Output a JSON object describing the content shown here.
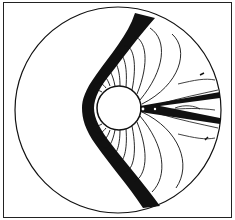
{
  "figure": {
    "type": "flow-contour-plot",
    "colors": {
      "line": "#111111",
      "background": "#ffffff"
    }
  }
}
